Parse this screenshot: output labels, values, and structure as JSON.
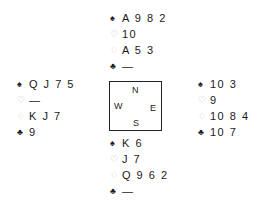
{
  "colors": {
    "black_suit": "#1a1a1a",
    "red_suit": "#b8b8b8",
    "text": "#1a1a1a",
    "compass_border": "#222222"
  },
  "suit_symbols": {
    "spades": "♠",
    "hearts": "♡",
    "diamonds": "♢",
    "clubs": "♣"
  },
  "hands": {
    "north": {
      "spades": "A 9 8 2",
      "hearts": "10",
      "diamonds": "A 5 3",
      "clubs": "—"
    },
    "west": {
      "spades": "Q J 7 5",
      "hearts": "—",
      "diamonds": "K J 7",
      "clubs": "9"
    },
    "east": {
      "spades": "10 3",
      "hearts": "9",
      "diamonds": "10 8 4",
      "clubs": "10 7"
    },
    "south": {
      "spades": "K 6",
      "hearts": "J 7",
      "diamonds": "Q 9 6 2",
      "clubs": "—"
    }
  },
  "compass": {
    "north": "N",
    "south": "S",
    "west": "W",
    "east": "E"
  }
}
